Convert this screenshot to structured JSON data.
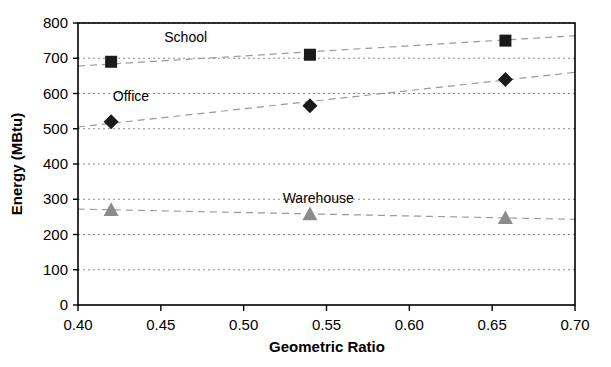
{
  "chart_data": {
    "type": "scatter",
    "title": "",
    "xlabel": "Geometric Ratio",
    "ylabel": "Energy (MBtu)",
    "xlim": [
      0.4,
      0.7
    ],
    "ylim": [
      0,
      800
    ],
    "grid": true,
    "legend_position": "inline-annotations",
    "x_ticks": [
      "0.40",
      "0.45",
      "0.50",
      "0.55",
      "0.60",
      "0.65",
      "0.70"
    ],
    "x_tick_values": [
      0.4,
      0.45,
      0.5,
      0.55,
      0.6,
      0.65,
      0.7
    ],
    "y_ticks": [
      "0",
      "100",
      "200",
      "300",
      "400",
      "500",
      "600",
      "700",
      "800"
    ],
    "y_tick_values": [
      0,
      100,
      200,
      300,
      400,
      500,
      600,
      700,
      800
    ],
    "x": [
      0.42,
      0.54,
      0.658
    ],
    "series": [
      {
        "name": "School",
        "marker": "square",
        "color": "#1a1a1a",
        "values": [
          690,
          710,
          750
        ],
        "label_x": 0.465,
        "label_y": 745,
        "trend": {
          "x0": 0.4,
          "y0": 678,
          "x1": 0.7,
          "y1": 764
        }
      },
      {
        "name": "Office",
        "marker": "diamond",
        "color": "#1a1a1a",
        "values": [
          520,
          565,
          640
        ],
        "label_x": 0.432,
        "label_y": 578,
        "trend": {
          "x0": 0.4,
          "y0": 505,
          "x1": 0.7,
          "y1": 660
        }
      },
      {
        "name": "Warehouse",
        "marker": "triangle",
        "color": "#8c8c8c",
        "values": [
          270,
          258,
          247
        ],
        "label_x": 0.545,
        "label_y": 290,
        "trend": {
          "x0": 0.4,
          "y0": 272,
          "x1": 0.7,
          "y1": 243
        }
      }
    ]
  }
}
